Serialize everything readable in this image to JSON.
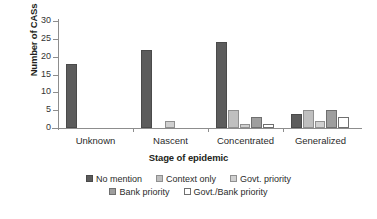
{
  "chart_data": {
    "type": "bar",
    "title": "",
    "xlabel": "Stage of epidemic",
    "ylabel": "Number of CASs",
    "categories": [
      "Unknown",
      "Nascent",
      "Concentrated",
      "Generalized"
    ],
    "ylim": [
      0,
      30
    ],
    "yticks": [
      0,
      5,
      10,
      15,
      20,
      25,
      30
    ],
    "grid": false,
    "legend_position": "bottom",
    "series": [
      {
        "name": "No mention",
        "color": "#5c5c5c",
        "values": [
          18,
          22,
          24,
          4
        ]
      },
      {
        "name": "Context only",
        "color": "#bfbfbf",
        "values": [
          0,
          0,
          5,
          5
        ]
      },
      {
        "name": "Govt. priority",
        "color": "#d0d0d0",
        "values": [
          0,
          2,
          1,
          2
        ]
      },
      {
        "name": "Bank priority",
        "color": "#9e9e9e",
        "values": [
          0,
          0,
          3,
          5
        ]
      },
      {
        "name": "Govt./Bank priority",
        "color": "#ffffff",
        "values": [
          0,
          0,
          1,
          3
        ]
      }
    ]
  }
}
